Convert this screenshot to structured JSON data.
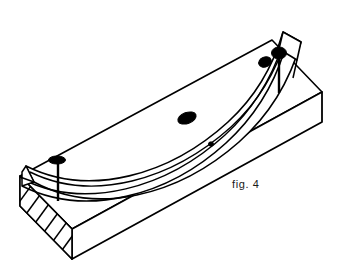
{
  "figure": {
    "caption": "fig. 4",
    "title": "fig. 4",
    "background_color": "#ffffff",
    "line_color": "#000000",
    "fill_color": "#ffffff",
    "nail_color": "#000000",
    "caption_color": "#1a1a1a",
    "parts": {
      "block_label": "rectangular block",
      "strip_label": "curved laminated strip",
      "end_section_label": "hatched end section",
      "nail_left_label": "nail-left",
      "nail_mid_head_label": "nail-head-middle",
      "nail_small_tack_label": "tack-small",
      "nail_right_inner_label": "nail-head-right-inner",
      "nail_right_label": "nail-right"
    }
  }
}
